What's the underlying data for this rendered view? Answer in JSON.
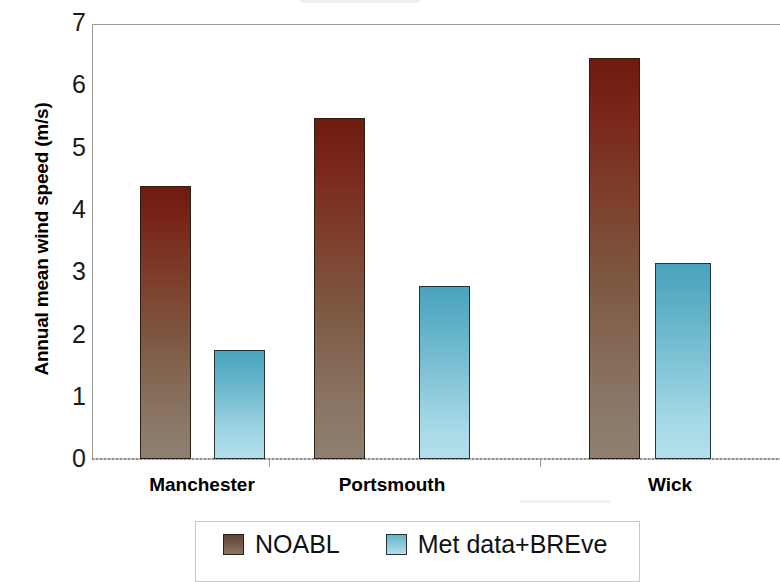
{
  "chart_data": {
    "type": "bar",
    "title": "",
    "xlabel": "",
    "ylabel": "Annual mean wind speed (m/s)",
    "categories": [
      "Manchester",
      "Portsmouth",
      "Wick"
    ],
    "series": [
      {
        "name": "NOABL",
        "color": "#7d3c29",
        "values": [
          4.4,
          5.48,
          6.45
        ]
      },
      {
        "name": "Met data+BREve",
        "color": "#66b3c9",
        "values": [
          1.75,
          2.78,
          3.16
        ]
      }
    ],
    "ylim": [
      0,
      7
    ],
    "yticks": [
      "0",
      "1",
      "2",
      "3",
      "4",
      "5",
      "6",
      "7"
    ],
    "grid": false,
    "legend_position": "bottom"
  },
  "axes": {
    "y_title": "Annual mean wind speed (m/s)",
    "y_tick_labels": [
      "7",
      "6",
      "5",
      "4",
      "3",
      "2",
      "1",
      "0"
    ],
    "x_tick_labels": [
      "Manchester",
      "Portsmouth",
      "Wick"
    ]
  },
  "legend": {
    "entries": [
      {
        "label": "NOABL",
        "swatch": "noabl-swatch"
      },
      {
        "label": "Met data+BREve",
        "swatch": "met-swatch"
      }
    ]
  }
}
